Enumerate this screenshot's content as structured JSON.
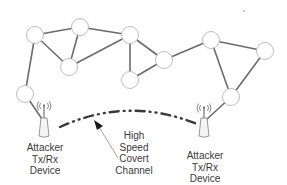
{
  "diagram": {
    "type": "network-topology",
    "colors": {
      "edge": "#6b6b6b",
      "node_stroke": "#bdbdbd",
      "node_fill": "#ffffff",
      "covert_channel": "#3a3a3a",
      "text": "#3a3a3a"
    },
    "nodes": [
      {
        "id": "A",
        "x": 35,
        "y": 35
      },
      {
        "id": "B",
        "x": 80,
        "y": 27
      },
      {
        "id": "C",
        "x": 69,
        "y": 67
      },
      {
        "id": "D",
        "x": 25,
        "y": 94
      },
      {
        "id": "E",
        "x": 130,
        "y": 35
      },
      {
        "id": "F",
        "x": 164,
        "y": 60
      },
      {
        "id": "G",
        "x": 130,
        "y": 80
      },
      {
        "id": "H",
        "x": 211,
        "y": 40
      },
      {
        "id": "I",
        "x": 265,
        "y": 51
      },
      {
        "id": "J",
        "x": 231,
        "y": 97
      }
    ],
    "edges": [
      [
        "A",
        "B"
      ],
      [
        "A",
        "C"
      ],
      [
        "A",
        "D"
      ],
      [
        "B",
        "C"
      ],
      [
        "B",
        "E"
      ],
      [
        "C",
        "E"
      ],
      [
        "E",
        "F"
      ],
      [
        "E",
        "G"
      ],
      [
        "F",
        "G"
      ],
      [
        "F",
        "H"
      ],
      [
        "H",
        "I"
      ],
      [
        "H",
        "J"
      ],
      [
        "I",
        "J"
      ],
      [
        "D",
        "left_device"
      ],
      [
        "J",
        "right_device"
      ]
    ],
    "devices": {
      "left": {
        "x": 44,
        "y": 128,
        "label_lines": [
          "Attacker",
          "Tx/Rx",
          "Device"
        ]
      },
      "right": {
        "x": 204,
        "y": 126,
        "label_lines": [
          "Attacker",
          "Tx/Rx",
          "Device"
        ]
      }
    },
    "covert_channel": {
      "label_lines": [
        "High",
        "Speed",
        "Covert",
        "Channel"
      ],
      "style": "dash-dot",
      "from": "left_device",
      "to": "right_device"
    },
    "annotation_dot": {
      "x": 244,
      "y": 11
    }
  }
}
